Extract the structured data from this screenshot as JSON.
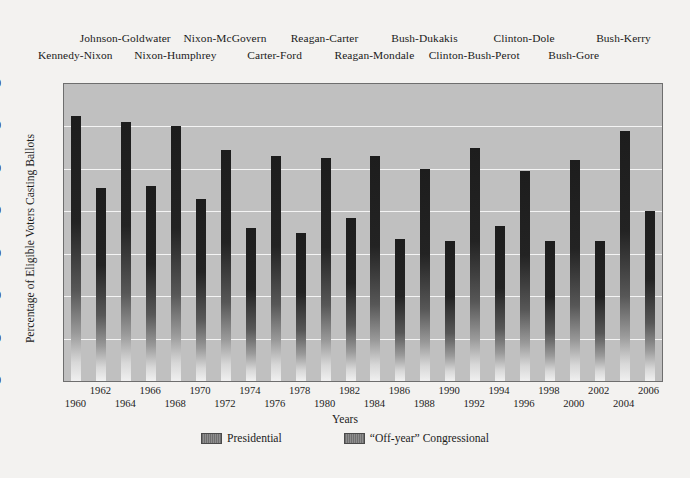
{
  "chart_data": {
    "type": "bar",
    "title": "",
    "xlabel": "Years",
    "ylabel": "Percentage of Eligible Voters Casting Ballots",
    "ylim": [
      0,
      70
    ],
    "ytick_values": [
      0,
      10,
      20,
      30,
      40,
      50,
      60,
      70
    ],
    "grid": true,
    "legend_position": "bottom",
    "legend": [
      "Presidential",
      "“Off-year” Congressional"
    ],
    "categories": [
      "1960",
      "1962",
      "1964",
      "1966",
      "1968",
      "1970",
      "1972",
      "1974",
      "1976",
      "1978",
      "1980",
      "1982",
      "1984",
      "1986",
      "1988",
      "1990",
      "1992",
      "1994",
      "1996",
      "1998",
      "2000",
      "2002",
      "2004",
      "2006"
    ],
    "values": [
      62.5,
      45.5,
      61,
      46,
      60,
      43,
      54.5,
      36,
      53,
      35,
      52.5,
      38.5,
      53,
      33.5,
      50,
      33,
      55,
      36.5,
      49.5,
      33,
      52,
      33,
      59,
      40
    ],
    "series_of": [
      "Presidential",
      "Off-year Congressional",
      "Presidential",
      "Off-year Congressional",
      "Presidential",
      "Off-year Congressional",
      "Presidential",
      "Off-year Congressional",
      "Presidential",
      "Off-year Congressional",
      "Presidential",
      "Off-year Congressional",
      "Presidential",
      "Off-year Congressional",
      "Presidential",
      "Off-year Congressional",
      "Presidential",
      "Off-year Congressional",
      "Presidential",
      "Off-year Congressional",
      "Presidential",
      "Off-year Congressional",
      "Presidential",
      "Off-year Congressional"
    ],
    "annotations": [
      {
        "text": "Kennedy-Nixon",
        "row": "lower",
        "year": 1960
      },
      {
        "text": "Johnson-Goldwater",
        "row": "upper",
        "year": 1964
      },
      {
        "text": "Nixon-Humphrey",
        "row": "lower",
        "year": 1968
      },
      {
        "text": "Nixon-McGovern",
        "row": "upper",
        "year": 1972
      },
      {
        "text": "Carter-Ford",
        "row": "lower",
        "year": 1976
      },
      {
        "text": "Reagan-Carter",
        "row": "upper",
        "year": 1980
      },
      {
        "text": "Reagan-Mondale",
        "row": "lower",
        "year": 1984
      },
      {
        "text": "Bush-Dukakis",
        "row": "upper",
        "year": 1988
      },
      {
        "text": "Clinton-Bush-Perot",
        "row": "lower",
        "year": 1992
      },
      {
        "text": "Clinton-Dole",
        "row": "upper",
        "year": 1996
      },
      {
        "text": "Bush-Gore",
        "row": "lower",
        "year": 2000
      },
      {
        "text": "Bush-Kerry",
        "row": "upper",
        "year": 2004
      }
    ]
  },
  "colors": {
    "page_background": "#f3f2f0",
    "plot_background": "#c0c0c0",
    "gridline": "#f4f4f4",
    "bar_dark": "#1d1d1d",
    "bar_light": "#f0f0f0",
    "frame_border": "#6e6e6e",
    "text": "#1c1c1c"
  }
}
